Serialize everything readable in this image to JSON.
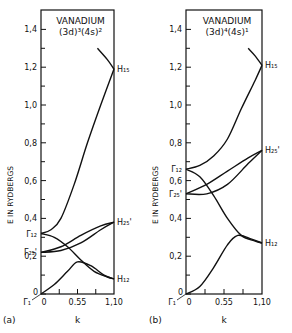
{
  "chart_data": [
    {
      "type": "line",
      "panel_label": "(a)",
      "title": "VANADIUM",
      "subtitle": "(3d)³(4s)²",
      "xlabel": "k",
      "ylabel": "E IN RYDBERGS",
      "xticks": [
        "0",
        "0.55",
        "1.10"
      ],
      "yticks": [
        "0",
        "0.2",
        "0.4",
        "0.6",
        "0.8",
        "1.0",
        "1.2",
        "1.4"
      ],
      "xlim": [
        0,
        1.1
      ],
      "ylim": [
        0,
        1.5
      ],
      "point_labels": {
        "left": [
          "Γ₁",
          "Γ₂₅'",
          "Γ₁₂"
        ],
        "right": [
          "H₁₅",
          "H₂₅'",
          "H₁₂"
        ]
      },
      "series": [
        {
          "name": "Γ1-lower",
          "x": [
            0,
            0.2,
            0.4,
            0.55,
            0.75,
            0.95,
            1.1
          ],
          "values": [
            0,
            0.05,
            0.12,
            0.17,
            0.15,
            0.1,
            0.08
          ]
        },
        {
          "name": "Γ12-H12",
          "x": [
            0,
            0.2,
            0.4,
            0.6,
            0.8,
            1.0,
            1.1
          ],
          "values": [
            0.32,
            0.3,
            0.25,
            0.18,
            0.12,
            0.09,
            0.08
          ]
        },
        {
          "name": "Γ12-H15",
          "x": [
            0,
            0.15,
            0.3,
            0.5,
            0.7,
            0.9,
            1.1
          ],
          "values": [
            0.32,
            0.34,
            0.4,
            0.58,
            0.8,
            1.0,
            1.19
          ]
        },
        {
          "name": "Γ25'-H25' upper",
          "x": [
            0,
            0.3,
            0.6,
            0.9,
            1.1
          ],
          "values": [
            0.22,
            0.25,
            0.31,
            0.36,
            0.38
          ]
        },
        {
          "name": "Γ25'-H25' lower",
          "x": [
            0,
            0.3,
            0.6,
            0.9,
            1.1
          ],
          "values": [
            0.22,
            0.23,
            0.27,
            0.34,
            0.38
          ]
        },
        {
          "name": "H15-upper",
          "x": [
            0.85,
            1.0,
            1.1
          ],
          "values": [
            1.3,
            1.24,
            1.19
          ]
        }
      ],
      "key_values": {
        "Γ12": 0.32,
        "Γ25'": 0.22,
        "Γ1": 0,
        "H15": 1.19,
        "H25'": 0.38,
        "H12": 0.08
      }
    },
    {
      "type": "line",
      "panel_label": "(b)",
      "title": "VANADIUM",
      "subtitle": "(3d)⁴(4s)¹",
      "xlabel": "k",
      "ylabel": "E IN RYDBERGS",
      "xticks": [
        "0",
        "0.55",
        "1.10"
      ],
      "yticks": [
        "0",
        "0.2",
        "0.4",
        "0.6",
        "0.8",
        "1.0",
        "1.2",
        "1.4"
      ],
      "xlim": [
        0,
        1.1
      ],
      "ylim": [
        0,
        1.5
      ],
      "point_labels": {
        "left": [
          "Γ₁",
          "Γ₂₅'",
          "Γ₁₂"
        ],
        "right": [
          "H₁₅",
          "H₂₅'",
          "H₁₂"
        ]
      },
      "series": [
        {
          "name": "Γ1-lower",
          "x": [
            0,
            0.2,
            0.4,
            0.6,
            0.75,
            0.95,
            1.1
          ],
          "values": [
            0,
            0.04,
            0.14,
            0.26,
            0.31,
            0.29,
            0.27
          ]
        },
        {
          "name": "Γ12-H12",
          "x": [
            0,
            0.2,
            0.4,
            0.6,
            0.8,
            1.0,
            1.1
          ],
          "values": [
            0.66,
            0.62,
            0.52,
            0.4,
            0.31,
            0.28,
            0.27
          ]
        },
        {
          "name": "Γ12-H15",
          "x": [
            0,
            0.2,
            0.4,
            0.6,
            0.8,
            1.0,
            1.1
          ],
          "values": [
            0.66,
            0.68,
            0.73,
            0.82,
            0.98,
            1.13,
            1.21
          ]
        },
        {
          "name": "Γ25'-H25' upper",
          "x": [
            0,
            0.3,
            0.6,
            0.9,
            1.1
          ],
          "values": [
            0.53,
            0.58,
            0.65,
            0.72,
            0.76
          ]
        },
        {
          "name": "Γ25'-H25' lower",
          "x": [
            0,
            0.3,
            0.6,
            0.9,
            1.1
          ],
          "values": [
            0.53,
            0.53,
            0.58,
            0.69,
            0.76
          ]
        },
        {
          "name": "H15-upper",
          "x": [
            0.9,
            1.0,
            1.1
          ],
          "values": [
            1.3,
            1.26,
            1.21
          ]
        }
      ],
      "key_values": {
        "Γ12": 0.66,
        "Γ25'": 0.53,
        "Γ1": 0,
        "H15": 1.21,
        "H25'": 0.76,
        "H12": 0.27
      }
    }
  ]
}
